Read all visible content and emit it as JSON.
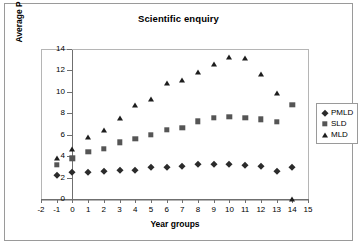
{
  "chart_data": {
    "type": "scatter",
    "title": "Scientific enquiry",
    "xlabel": "Year groups",
    "ylabel": "Average P levels",
    "xlim": [
      -2,
      15
    ],
    "ylim": [
      0,
      14
    ],
    "xticks": [
      -2,
      -1,
      0,
      1,
      2,
      3,
      4,
      5,
      6,
      7,
      8,
      9,
      10,
      11,
      12,
      13,
      14,
      15
    ],
    "yticks": [
      0,
      2,
      4,
      6,
      8,
      10,
      12,
      14
    ],
    "grid": false,
    "legend_position": "right",
    "x": [
      -1,
      0,
      1,
      2,
      3,
      4,
      5,
      6,
      7,
      8,
      9,
      10,
      11,
      12,
      13,
      14
    ],
    "series": [
      {
        "name": "PMLD",
        "marker": "diamond",
        "color": "#2b2b2b",
        "values": [
          2.2,
          2.5,
          2.55,
          2.6,
          2.7,
          2.75,
          2.95,
          3.0,
          3.1,
          3.25,
          3.3,
          3.3,
          3.2,
          3.05,
          2.6,
          2.95
        ]
      },
      {
        "name": "SLD",
        "marker": "square",
        "color": "#555555",
        "values": [
          3.2,
          3.8,
          4.4,
          4.7,
          5.3,
          5.6,
          6.0,
          6.45,
          6.65,
          7.25,
          7.6,
          7.65,
          7.6,
          7.45,
          7.2,
          8.8
        ]
      },
      {
        "name": "MLD",
        "marker": "triangle",
        "color": "#1d1d1d",
        "values": [
          3.85,
          4.7,
          5.8,
          6.45,
          7.55,
          8.8,
          9.3,
          10.8,
          11.1,
          11.9,
          12.6,
          13.3,
          13.2,
          11.7,
          9.9,
          0
        ]
      }
    ]
  },
  "legend": {
    "items": [
      {
        "label": "PMLD",
        "marker": "diamond"
      },
      {
        "label": "SLD",
        "marker": "square"
      },
      {
        "label": "MLD",
        "marker": "triangle"
      }
    ]
  }
}
